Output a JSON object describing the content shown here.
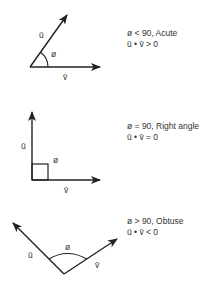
{
  "colors": {
    "stroke": "#222222",
    "text": "#333333",
    "background": "#ffffff"
  },
  "panels": [
    {
      "name": "acute",
      "labels": {
        "u": "ū",
        "v": "v̄",
        "angle": "ø"
      },
      "caption": {
        "line1": "ø < 90, Acute",
        "line2": "ū • v̄ > 0"
      }
    },
    {
      "name": "right",
      "labels": {
        "u": "ū",
        "v": "v̄",
        "angle": "ø"
      },
      "caption": {
        "line1": "ø = 90, Right angle",
        "line2": "ū • v̄ = 0"
      }
    },
    {
      "name": "obtuse",
      "labels": {
        "u": "ū",
        "v": "v̄",
        "angle": "ø"
      },
      "caption": {
        "line1": "ø > 90, Obtuse",
        "line2": "ū • v̄ < 0"
      }
    }
  ]
}
